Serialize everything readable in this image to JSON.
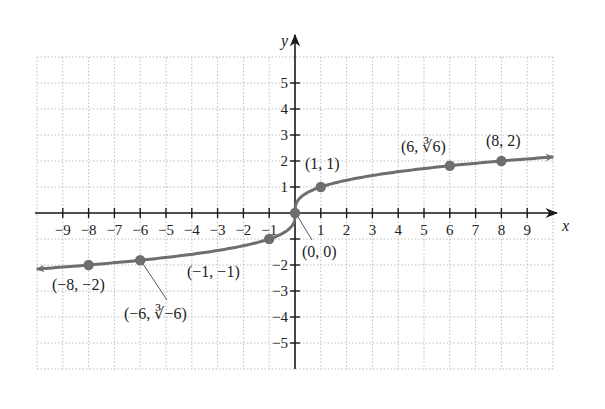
{
  "chart_data": {
    "type": "line",
    "title": "",
    "function": "y = cube root of x",
    "xlabel": "x",
    "ylabel": "y",
    "xlim": [
      -10,
      10
    ],
    "ylim": [
      -6,
      6
    ],
    "grid": true,
    "x_ticks": [
      -9,
      -8,
      -7,
      -6,
      -5,
      -4,
      -3,
      -2,
      -1,
      1,
      2,
      3,
      4,
      5,
      6,
      7,
      8,
      9
    ],
    "x_tick_labels": [
      "−9",
      "−8",
      "−7",
      "−6",
      "−5",
      "−4",
      "−3",
      "−2",
      "−1",
      "1",
      "2",
      "3",
      "4",
      "5",
      "6",
      "7",
      "8",
      "9"
    ],
    "y_ticks": [
      5,
      4,
      3,
      2,
      1,
      -1,
      -2,
      -3,
      -4,
      -5
    ],
    "y_tick_labels": [
      "5",
      "4",
      "3",
      "2",
      "1",
      "",
      "−2",
      "−3",
      "−4",
      "−5"
    ],
    "curve_x_range": [
      -10,
      10
    ],
    "arrows_at_ends": true,
    "points": [
      {
        "x": -8,
        "y": -2,
        "label": "(−8, −2)"
      },
      {
        "x": -6,
        "y": -1.817,
        "label": "(−6, ∛−6)"
      },
      {
        "x": -1,
        "y": -1,
        "label": "(−1, −1)"
      },
      {
        "x": 0,
        "y": 0,
        "label": "(0, 0)"
      },
      {
        "x": 1,
        "y": 1,
        "label": "(1, 1)"
      },
      {
        "x": 6,
        "y": 1.817,
        "label": "(6, ∛6)"
      },
      {
        "x": 8,
        "y": 2,
        "label": "(8, 2)"
      }
    ],
    "colors": {
      "curve": "#6e6e6e",
      "points": "#6e6e6e",
      "axes": "#1a1a1a",
      "grid": "#bdbdbd",
      "text": "#222222"
    }
  },
  "labels": {
    "x_axis": "x",
    "y_axis": "y",
    "p_m8": "(−8, −2)",
    "p_m6": "(−6, ∛−6)",
    "p_m1": "(−1, −1)",
    "p_0": "(0, 0)",
    "p_1": "(1, 1)",
    "p_6": "(6, ∛6)",
    "p_8": "(8, 2)"
  }
}
